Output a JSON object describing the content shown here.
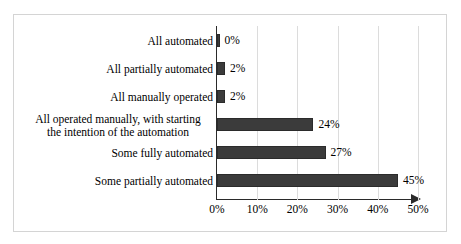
{
  "chart_data": {
    "type": "bar",
    "orientation": "horizontal",
    "title": "",
    "xlabel": "",
    "ylabel": "",
    "xlim": [
      0,
      50
    ],
    "xticks": [
      "0%",
      "10%",
      "20%",
      "30%",
      "40%",
      "50%"
    ],
    "xtick_values": [
      0,
      10,
      20,
      30,
      40,
      50
    ],
    "grid": true,
    "legend": "none",
    "categories": [
      "All automated",
      "All partially automated",
      "All manually operated",
      "All operated manually, with starting\nthe intention of the automation",
      "Some fully automated",
      "Some partially automated"
    ],
    "values": [
      0,
      2,
      2,
      24,
      27,
      45
    ],
    "value_labels": [
      "0%",
      "2%",
      "2%",
      "24%",
      "27%",
      "45%"
    ],
    "bar_color": "#3b3b3b",
    "bar_edge_color": "#2b2b2b",
    "gridline_color": "#dcdcdc",
    "axis_color": "#2a2a2a",
    "frame_border_color": "#d4d4d4",
    "background_color": "#ffffff"
  }
}
